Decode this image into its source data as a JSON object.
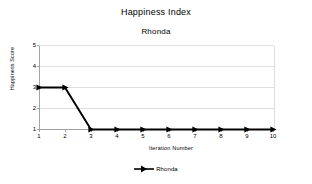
{
  "chart_data": {
    "type": "line",
    "title": "Happiness Index",
    "subtitle": "Rhonda",
    "xlabel": "Iteration Number",
    "ylabel": "Happiness Score",
    "x": [
      1,
      2,
      3,
      4,
      5,
      6,
      7,
      8,
      9,
      10
    ],
    "xticklabels": [
      "1",
      "2",
      "3",
      "4",
      "5",
      "6",
      "7",
      "8",
      "9",
      "10"
    ],
    "yticklabels": [
      "5",
      "4",
      "3",
      "2",
      "1"
    ],
    "yticks": [
      5,
      4,
      3,
      2,
      1
    ],
    "xlim": [
      1,
      10
    ],
    "ylim": [
      1,
      5
    ],
    "grid": "horizontal",
    "legend_position": "bottom",
    "series": [
      {
        "name": "Rhonda",
        "values": [
          3,
          3,
          1,
          1,
          1,
          1,
          1,
          1,
          1,
          1
        ],
        "color": "#000000",
        "marker": "triangle-right"
      }
    ]
  },
  "legend": {
    "entries": [
      {
        "label": "Rhonda"
      }
    ]
  }
}
